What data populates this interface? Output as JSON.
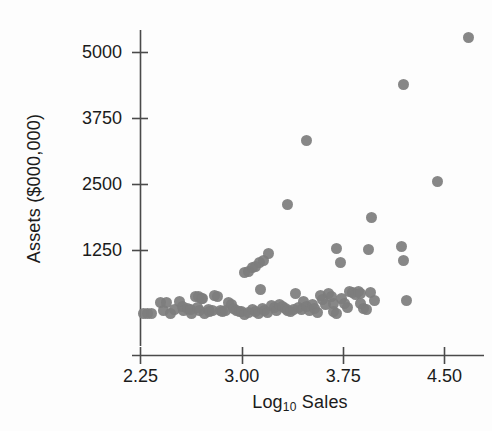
{
  "chart_data": {
    "type": "scatter",
    "title": "",
    "xlabel": "Log10 Sales",
    "xlabel_base": "Log",
    "xlabel_sub": "10",
    "xlabel_rest": " Sales",
    "ylabel": "Assets ($000,000)",
    "xlim": [
      2.2,
      4.75
    ],
    "ylim": [
      0,
      5500
    ],
    "xticks": [
      2.25,
      3.0,
      3.75,
      4.5
    ],
    "xtick_labels": [
      "2.25",
      "3.00",
      "3.75",
      "4.50"
    ],
    "yticks": [
      1250,
      2500,
      3750,
      5000
    ],
    "ytick_labels": [
      "1250",
      "2500",
      "3750",
      "5000"
    ],
    "grid": false,
    "legend": null,
    "marker_color": "#7d7d7d",
    "marker_size": 11,
    "axis_color": "#4a4a4a",
    "n_points": 96,
    "points": [
      [
        2.27,
        60
      ],
      [
        2.3,
        60
      ],
      [
        2.33,
        55
      ],
      [
        2.4,
        270
      ],
      [
        2.44,
        265
      ],
      [
        2.42,
        105
      ],
      [
        2.47,
        60
      ],
      [
        2.5,
        135
      ],
      [
        2.54,
        285
      ],
      [
        2.56,
        185
      ],
      [
        2.57,
        105
      ],
      [
        2.6,
        160
      ],
      [
        2.63,
        55
      ],
      [
        2.62,
        130
      ],
      [
        2.66,
        380
      ],
      [
        2.68,
        385
      ],
      [
        2.7,
        350
      ],
      [
        2.71,
        345
      ],
      [
        2.67,
        170
      ],
      [
        2.69,
        115
      ],
      [
        2.72,
        60
      ],
      [
        2.75,
        135
      ],
      [
        2.76,
        90
      ],
      [
        2.78,
        120
      ],
      [
        2.8,
        390
      ],
      [
        2.82,
        385
      ],
      [
        2.84,
        110
      ],
      [
        2.86,
        95
      ],
      [
        2.88,
        105
      ],
      [
        2.9,
        260
      ],
      [
        2.92,
        230
      ],
      [
        2.94,
        150
      ],
      [
        2.96,
        110
      ],
      [
        2.98,
        95
      ],
      [
        3.02,
        840
      ],
      [
        3.05,
        860
      ],
      [
        3.08,
        930
      ],
      [
        3.1,
        950
      ],
      [
        3.13,
        1015
      ],
      [
        3.16,
        1060
      ],
      [
        3.2,
        1185
      ],
      [
        3.0,
        100
      ],
      [
        3.02,
        40
      ],
      [
        3.05,
        85
      ],
      [
        3.08,
        130
      ],
      [
        3.1,
        95
      ],
      [
        3.12,
        60
      ],
      [
        3.15,
        160
      ],
      [
        3.17,
        110
      ],
      [
        3.19,
        70
      ],
      [
        3.14,
        520
      ],
      [
        3.22,
        215
      ],
      [
        3.24,
        175
      ],
      [
        3.26,
        120
      ],
      [
        3.28,
        235
      ],
      [
        3.3,
        190
      ],
      [
        3.32,
        145
      ],
      [
        3.34,
        120
      ],
      [
        3.36,
        95
      ],
      [
        3.38,
        135
      ],
      [
        3.34,
        2130
      ],
      [
        3.4,
        435
      ],
      [
        3.42,
        175
      ],
      [
        3.44,
        130
      ],
      [
        3.46,
        285
      ],
      [
        3.48,
        185
      ],
      [
        3.5,
        110
      ],
      [
        3.48,
        3340
      ],
      [
        3.52,
        230
      ],
      [
        3.54,
        145
      ],
      [
        3.56,
        70
      ],
      [
        3.58,
        390
      ],
      [
        3.6,
        330
      ],
      [
        3.62,
        235
      ],
      [
        3.64,
        440
      ],
      [
        3.66,
        370
      ],
      [
        3.68,
        255
      ],
      [
        3.7,
        1285
      ],
      [
        3.68,
        90
      ],
      [
        3.7,
        55
      ],
      [
        3.73,
        1025
      ],
      [
        3.74,
        340
      ],
      [
        3.76,
        250
      ],
      [
        3.78,
        175
      ],
      [
        3.8,
        480
      ],
      [
        3.82,
        455
      ],
      [
        3.84,
        420
      ],
      [
        3.86,
        470
      ],
      [
        3.88,
        430
      ],
      [
        3.88,
        250
      ],
      [
        3.9,
        150
      ],
      [
        3.92,
        125
      ],
      [
        3.94,
        1270
      ],
      [
        3.96,
        1870
      ],
      [
        3.95,
        450
      ],
      [
        3.98,
        310
      ],
      [
        4.18,
        1325
      ],
      [
        4.2,
        1060
      ],
      [
        4.2,
        4400
      ],
      [
        4.22,
        310
      ],
      [
        4.45,
        2560
      ],
      [
        4.68,
        5275
      ]
    ]
  }
}
